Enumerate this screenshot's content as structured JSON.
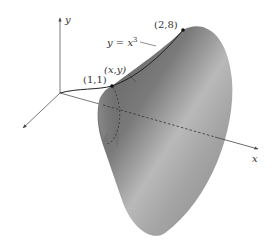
{
  "figure": {
    "axes": {
      "x_label": "x",
      "y_label": "y"
    },
    "curve": {
      "equation_lhs": "y = x",
      "equation_exp": "3"
    },
    "points": {
      "start": "(1,1)",
      "end": "(2,8)",
      "generic": "(x,y)"
    },
    "colors": {
      "surface_dark": "#6e6e6e",
      "surface_light": "#c8c8c8",
      "axis": "#555555",
      "curve": "#222222",
      "text": "#333333"
    }
  }
}
